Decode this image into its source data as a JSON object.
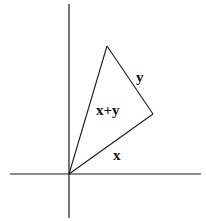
{
  "diagram": {
    "colors": {
      "line": "#1a1a1a",
      "background": "#ffffff",
      "text": "#111111"
    },
    "axes": {
      "vertical": {
        "x1": 69,
        "y1": 4,
        "x2": 69,
        "y2": 218
      },
      "horizontal": {
        "x1": 10,
        "y1": 174,
        "x2": 201,
        "y2": 174
      }
    },
    "vertices": {
      "origin": {
        "x": 69,
        "y": 174
      },
      "apex": {
        "x": 107,
        "y": 46
      },
      "right": {
        "x": 153,
        "y": 114
      }
    },
    "labels": {
      "x": "x",
      "y": "y",
      "sum": "x+y"
    },
    "label_positions": {
      "x": {
        "x": 113,
        "y": 160
      },
      "y": {
        "x": 136,
        "y": 82
      },
      "sum": {
        "x": 96,
        "y": 115
      }
    }
  }
}
